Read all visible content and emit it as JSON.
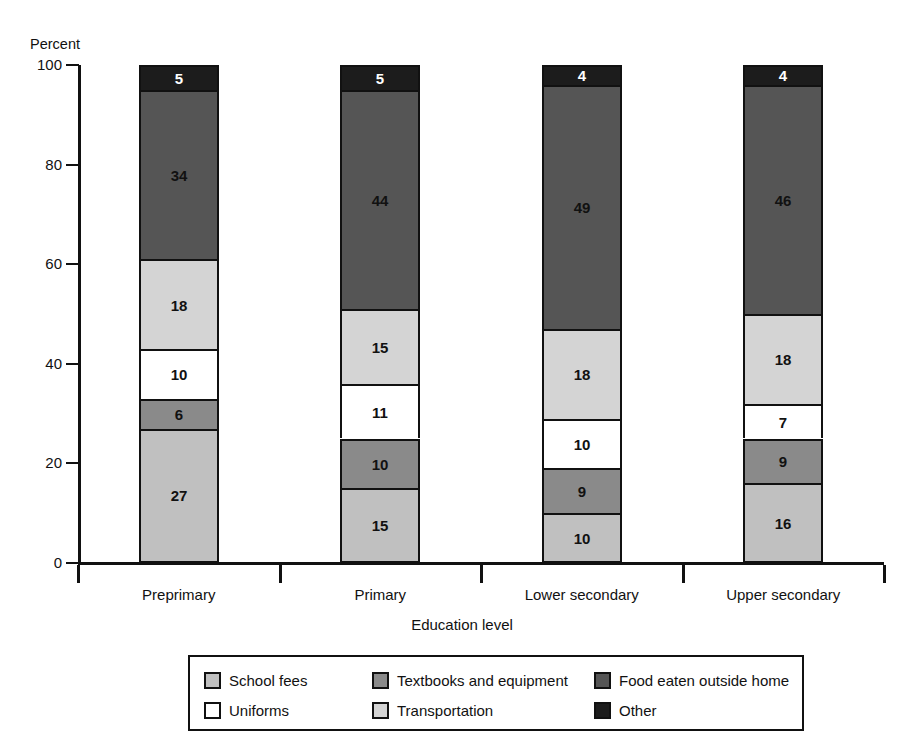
{
  "figure": {
    "title": "",
    "xlabel": "Education level",
    "ylabel": "Percent"
  },
  "axis": {
    "yticks": [
      "100",
      "80",
      "60",
      "40",
      "20",
      "0"
    ]
  },
  "legend": {
    "items": [
      {
        "label": "School fees",
        "color": "#c0c0c0"
      },
      {
        "label": "Textbooks and equipment",
        "color": "#8a8a8a"
      },
      {
        "label": "Food eaten outside home",
        "color": "#555555"
      },
      {
        "label": "Uniforms",
        "color": "#ffffff"
      },
      {
        "label": "Transportation",
        "color": "#d4d4d4"
      },
      {
        "label": "Other",
        "color": "#1c1c1c"
      }
    ]
  },
  "chart_data": {
    "type": "bar",
    "title": "",
    "xlabel": "Education level",
    "ylabel": "Percent",
    "ylim": [
      0,
      100
    ],
    "yticks": [
      0,
      20,
      40,
      60,
      80,
      100
    ],
    "grid": false,
    "stacked": true,
    "legend_position": "bottom",
    "categories": [
      "Preprimary",
      "Primary",
      "Lower secondary",
      "Upper secondary"
    ],
    "series": [
      {
        "name": "School fees",
        "color": "#c0c0c0",
        "values": [
          27,
          15,
          10,
          16
        ]
      },
      {
        "name": "Textbooks and equipment",
        "color": "#8a8a8a",
        "values": [
          6,
          10,
          9,
          9
        ]
      },
      {
        "name": "Uniforms",
        "color": "#ffffff",
        "values": [
          10,
          11,
          10,
          7
        ]
      },
      {
        "name": "Transportation",
        "color": "#d4d4d4",
        "values": [
          18,
          15,
          18,
          18
        ]
      },
      {
        "name": "Food eaten outside home",
        "color": "#555555",
        "values": [
          34,
          44,
          49,
          46
        ]
      },
      {
        "name": "Other",
        "color": "#1c1c1c",
        "values": [
          5,
          5,
          4,
          4
        ]
      }
    ]
  }
}
